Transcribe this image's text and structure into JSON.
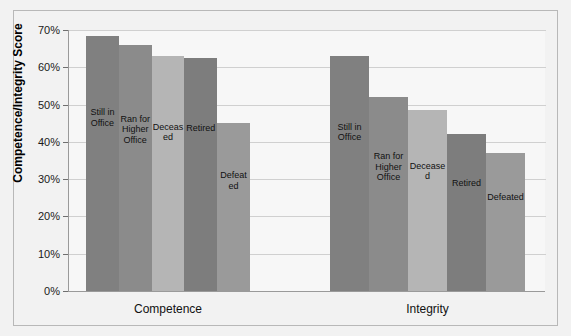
{
  "chart_data": {
    "type": "bar",
    "title": "",
    "xlabel": "",
    "ylabel": "Competence/Integrity Score",
    "ylim": [
      0,
      70
    ],
    "ytick_labels": [
      "0%",
      "10%",
      "20%",
      "30%",
      "40%",
      "50%",
      "60%",
      "70%"
    ],
    "ytick_values": [
      0,
      10,
      20,
      30,
      40,
      50,
      60,
      70
    ],
    "grid": true,
    "legend_position": "none",
    "categories": [
      "Competence",
      "Integrity"
    ],
    "series": [
      {
        "name": "Still in Office",
        "values": [
          68.5,
          63.0
        ],
        "color": "#808080"
      },
      {
        "name": "Ran for Higher Office",
        "values": [
          66.0,
          52.0
        ],
        "color": "#8b8b8b"
      },
      {
        "name": "Deceased",
        "values": [
          63.0,
          48.5
        ],
        "color": "#b5b5b5"
      },
      {
        "name": "Retired",
        "values": [
          62.5,
          42.0
        ],
        "color": "#7d7d7d"
      },
      {
        "name": "Defeated",
        "values": [
          45.0,
          37.0
        ],
        "color": "#9a9a9a"
      }
    ],
    "groups": [
      {
        "label": "Competence",
        "bars": [
          {
            "label": "Still in Office",
            "value": 68.5,
            "color": "#808080"
          },
          {
            "label": "Ran for Higher Office",
            "value": 66.0,
            "color": "#8b8b8b"
          },
          {
            "label": "Deceased",
            "value": 63.0,
            "color": "#b5b5b5"
          },
          {
            "label": "Retired",
            "value": 62.5,
            "color": "#7d7d7d"
          },
          {
            "label": "Defeated",
            "value": 45.0,
            "color": "#9a9a9a"
          }
        ]
      },
      {
        "label": "Integrity",
        "bars": [
          {
            "label": "Still in Office",
            "value": 63.0,
            "color": "#808080"
          },
          {
            "label": "Ran for Higher Office",
            "value": 52.0,
            "color": "#8b8b8b"
          },
          {
            "label": "Deceased",
            "value": 48.5,
            "color": "#b5b5b5"
          },
          {
            "label": "Retired",
            "value": 42.0,
            "color": "#7d7d7d"
          },
          {
            "label": "Defeated",
            "value": 37.0,
            "color": "#9a9a9a"
          }
        ]
      }
    ]
  },
  "colors": {
    "page_background": "#f2f2f2",
    "plot_background": "#f7f7f7",
    "gridline": "#d0d0d0",
    "axis": "#9a9a9a",
    "border": "#b8b8b8",
    "text": "#111111"
  }
}
